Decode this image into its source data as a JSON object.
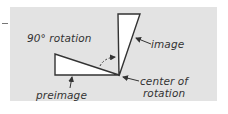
{
  "figure": {
    "type": "rotation-diagram",
    "colors": {
      "panel_background": "#e3e3e3",
      "shape_fill": "#ffffff",
      "stroke": "#333333",
      "text": "#333333"
    },
    "labels": {
      "rotation": "90° rotation",
      "image": "image",
      "center_line1": "center of",
      "center_line2": "rotation",
      "preimage": "preimage"
    },
    "shapes": {
      "preimage_triangle": {
        "points": [
          [
            55,
            54
          ],
          [
            55,
            75
          ],
          [
            119,
            75
          ]
        ]
      },
      "image_triangle": {
        "points": [
          [
            118,
            14
          ],
          [
            140,
            14
          ],
          [
            119,
            76
          ]
        ]
      },
      "center_point": [
        119,
        75
      ],
      "rotation_angle_deg": 90
    }
  }
}
